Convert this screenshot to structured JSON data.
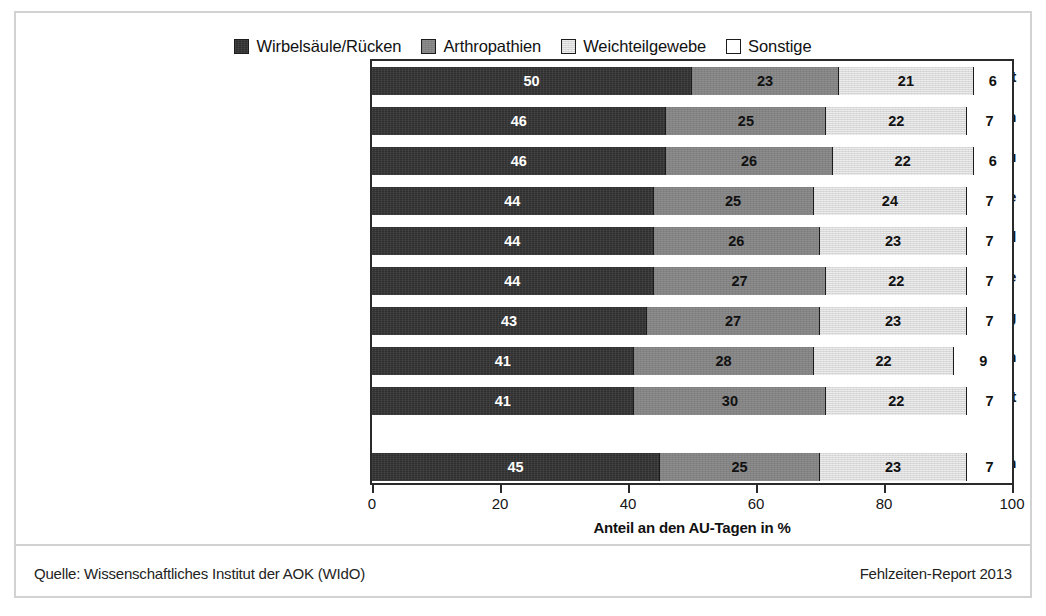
{
  "chart_data": {
    "type": "bar",
    "orientation": "horizontal",
    "stacked": true,
    "title": "",
    "xlabel": "Anteil an den AU-Tagen in %",
    "ylabel": "",
    "xlim": [
      0,
      100
    ],
    "xticks": [
      0,
      20,
      40,
      60,
      80,
      100
    ],
    "grid": false,
    "legend_position": "top-center",
    "categories": [
      "Verkehr/Transport",
      "Dienstleistungen",
      "Energie/Wasser/Entsorgung/Bergbau",
      "Verarbeitendes Gewerbe",
      "Handel",
      "Baugewerbe",
      "Öffentl. Verwaltung/Sozialversicherung",
      "Banken/Versicherungen",
      "Land- und Forstwirtschaft",
      "Alle Branchen"
    ],
    "series": [
      {
        "name": "Wirbelsäule/Rücken",
        "color": "#2f2f2f",
        "values": [
          50,
          46,
          46,
          44,
          44,
          44,
          43,
          41,
          41,
          45
        ]
      },
      {
        "name": "Arthropathien",
        "color": "#838383",
        "values": [
          23,
          25,
          26,
          25,
          26,
          27,
          27,
          28,
          30,
          25
        ]
      },
      {
        "name": "Weichteilgewebe",
        "color": "#d9d9d9",
        "values": [
          21,
          22,
          22,
          24,
          23,
          22,
          23,
          22,
          22,
          23
        ]
      },
      {
        "name": "Sonstige",
        "color": "#ffffff",
        "values": [
          6,
          7,
          6,
          7,
          7,
          7,
          7,
          9,
          7,
          7
        ]
      }
    ]
  },
  "legend": {
    "entries": [
      {
        "label": "Wirbelsäule/Rücken",
        "color": "#2f2f2f"
      },
      {
        "label": "Arthropathien",
        "color": "#838383"
      },
      {
        "label": "Weichteilgewebe",
        "color": "#d9d9d9"
      },
      {
        "label": "Sonstige",
        "color": "#ffffff"
      }
    ]
  },
  "footer": {
    "source": "Quelle: Wissenschaftliches Institut der AOK (WIdO)",
    "report": "Fehlzeiten-Report 2013"
  }
}
